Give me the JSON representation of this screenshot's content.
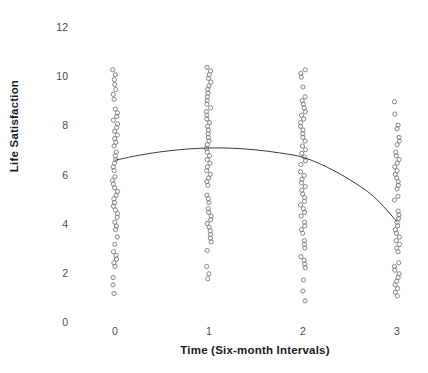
{
  "chart_data": {
    "type": "scatter",
    "title": "",
    "subtitle": "",
    "xlabel": "Time (Six-month Intervals)",
    "ylabel": "Life Satisfaction",
    "xlim": [
      -0.45,
      3.45
    ],
    "ylim": [
      0,
      12
    ],
    "xticks": [
      0,
      1,
      2,
      3
    ],
    "xticklabels": [
      "0",
      "1",
      "2",
      "3"
    ],
    "yticks": [
      0,
      2,
      4,
      6,
      8,
      10,
      12
    ],
    "yticklabels": [
      "0",
      "2",
      "4",
      "6",
      "8",
      "10",
      "12"
    ],
    "grid": false,
    "legend": null,
    "legend_position": "none",
    "marker": {
      "shape": "open-circle",
      "radius": 2.1,
      "stroke": "#7a7a7a",
      "stroke_width": 0.9,
      "fill": "none"
    },
    "series": [
      {
        "name": "Time 0",
        "x": 0,
        "observed_range": [
          1.2,
          10.3
        ],
        "values": [
          10.3,
          10.1,
          9.9,
          9.7,
          9.5,
          9.3,
          9.1,
          8.7,
          8.55,
          8.4,
          8.25,
          8.1,
          7.95,
          7.8,
          7.65,
          7.5,
          7.35,
          7.2,
          6.95,
          6.8,
          6.65,
          6.5,
          6.35,
          6.2,
          5.95,
          5.8,
          5.65,
          5.5,
          5.35,
          5.2,
          5.05,
          4.9,
          4.75,
          4.6,
          4.45,
          4.3,
          4.1,
          3.95,
          3.8,
          3.5,
          3.2,
          2.9,
          2.75,
          2.6,
          2.45,
          2.3,
          1.85,
          1.55,
          1.2
        ]
      },
      {
        "name": "Time 1",
        "x": 1,
        "observed_range": [
          1.8,
          10.4
        ],
        "values": [
          10.4,
          10.25,
          10.1,
          9.95,
          9.8,
          9.65,
          9.5,
          9.35,
          9.2,
          9.05,
          8.9,
          8.75,
          8.6,
          8.45,
          8.3,
          8.15,
          8.0,
          7.85,
          7.7,
          7.55,
          7.4,
          7.25,
          7.1,
          6.95,
          6.8,
          6.65,
          6.5,
          6.35,
          6.2,
          6.05,
          5.9,
          5.75,
          5.6,
          5.2,
          5.05,
          4.9,
          4.65,
          4.5,
          4.35,
          4.2,
          4.05,
          3.9,
          3.75,
          3.6,
          3.45,
          3.3,
          2.95,
          2.3,
          2.0,
          1.8
        ]
      },
      {
        "name": "Time 2",
        "x": 2,
        "observed_range": [
          0.9,
          10.3
        ],
        "values": [
          10.3,
          10.15,
          10.0,
          9.6,
          9.2,
          9.05,
          8.9,
          8.75,
          8.6,
          8.45,
          8.3,
          8.15,
          8.0,
          7.85,
          7.7,
          7.55,
          7.4,
          7.2,
          7.05,
          6.9,
          6.75,
          6.6,
          6.45,
          6.15,
          6.0,
          5.85,
          5.7,
          5.55,
          5.4,
          5.25,
          5.1,
          4.95,
          4.8,
          4.65,
          4.5,
          4.35,
          4.1,
          3.95,
          3.8,
          3.65,
          3.35,
          3.2,
          3.05,
          2.7,
          2.55,
          2.4,
          2.25,
          1.75,
          1.3,
          0.9
        ]
      },
      {
        "name": "Time 3",
        "x": 3,
        "observed_range": [
          1.1,
          9.0
        ],
        "values": [
          9.0,
          8.5,
          8.05,
          7.9,
          7.55,
          7.4,
          7.25,
          6.95,
          6.8,
          6.65,
          6.5,
          6.35,
          6.2,
          6.05,
          5.9,
          5.75,
          5.6,
          5.45,
          5.15,
          5.0,
          4.55,
          4.4,
          4.25,
          4.1,
          3.95,
          3.8,
          3.65,
          3.5,
          3.35,
          3.2,
          3.05,
          2.9,
          2.45,
          2.3,
          2.15,
          2.0,
          1.85,
          1.7,
          1.55,
          1.4,
          1.25,
          1.1
        ]
      }
    ],
    "fit_curve": {
      "name": "quadratic-trend",
      "type": "line",
      "stroke": "#3b3b3b",
      "stroke_width": 1.0,
      "x": [
        0,
        0.25,
        0.5,
        0.75,
        1,
        1.25,
        1.5,
        1.75,
        2,
        2.25,
        2.5,
        2.75,
        3
      ],
      "y": [
        6.62,
        6.82,
        6.97,
        7.07,
        7.12,
        7.11,
        7.04,
        6.92,
        6.74,
        6.35,
        5.82,
        5.15,
        4.12
      ]
    }
  }
}
